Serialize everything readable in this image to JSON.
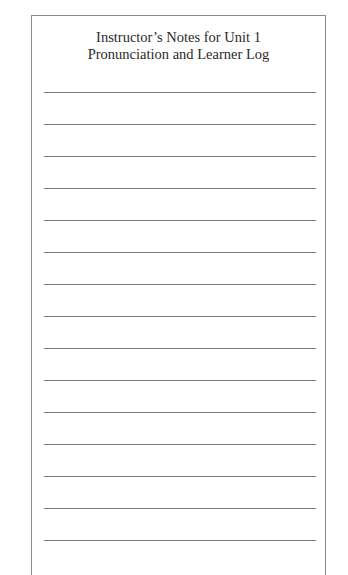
{
  "page": {
    "title_line_1": "Instructor’s Notes for Unit 1",
    "title_line_2": "Pronunciation and Learner Log"
  },
  "writing_lines": {
    "count": 15,
    "first_y": 91,
    "spacing": 32,
    "color": "#7a7a7a"
  },
  "colors": {
    "border": "#8a8a8a",
    "text": "#2a2a2a",
    "background": "#ffffff"
  }
}
